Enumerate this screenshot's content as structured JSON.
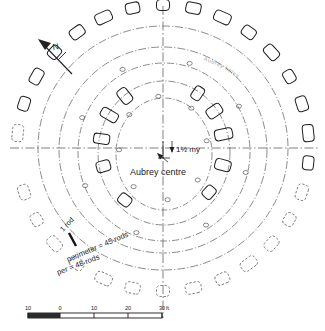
{
  "figure": {
    "kind": "archaeological-site-plan",
    "background_color": "#ffffff",
    "ink_color": "#222222",
    "faint_ink_color": "#9a9a9a"
  },
  "annotations": {
    "north_label": "N",
    "centre_offset_label": "1½ my",
    "centre_label": "Aubrey centre",
    "rod_label": "1 rod",
    "perimeter_outer_label": "perimeter = 45 rods",
    "perimeter_inner_label": "per = 48 rods",
    "arc_label_right": "Aubrey holes"
  },
  "scale_bar": {
    "unit_label": "ft",
    "ticks": [
      "10",
      "0",
      "10",
      "20",
      "30"
    ],
    "tick_positions_px": [
      10,
      42,
      76,
      110,
      144
    ],
    "hatched_from_px": 10,
    "hatched_to_px": 42,
    "bar_y_px": 313,
    "bar_height_px": 5
  },
  "chart_data": {
    "type": "scatter",
    "xlabel": "",
    "ylabel": "",
    "centre_px": [
      163,
      148
    ],
    "rings": [
      {
        "name": "sarsen-circle-outer-stones",
        "rx": 146,
        "ry": 143,
        "style": "solid",
        "stone_count": 30
      },
      {
        "name": "aubrey-dashed-ring",
        "rx": 120,
        "ry": 117,
        "style": "dashdot",
        "stone_count": 0
      },
      {
        "name": "bluestone-circle",
        "rx": 98,
        "ry": 96,
        "style": "dashdot",
        "stone_count": 0
      },
      {
        "name": "sarsen-trilithon-ring",
        "rx": 80,
        "ry": 84,
        "style": "dashdot",
        "stone_count": 0
      },
      {
        "name": "inner-bluestone-oval",
        "rx": 60,
        "ry": 66,
        "style": "dashdot",
        "stone_count": 0
      },
      {
        "name": "horseshoe-inner",
        "rx": 44,
        "ry": 52,
        "style": "dashdot",
        "stone_count": 0
      }
    ],
    "outer_stones_deg": [
      90,
      78,
      66,
      54,
      42,
      30,
      18,
      6,
      -6,
      -18,
      -30,
      -42,
      -54,
      -66,
      -78,
      -90,
      -102,
      -114,
      -126,
      -138,
      -150,
      -162,
      174,
      162,
      150,
      138,
      126,
      114,
      102
    ],
    "outer_stone_styles": [
      "solid",
      "solid",
      "solid",
      "solid",
      "solid",
      "solid",
      "solid",
      "solid",
      "solid",
      "dashed",
      "dashed",
      "dashed",
      "dashed",
      "dashed",
      "dashed",
      "dashed",
      "dashed",
      "dashed",
      "dashed",
      "dashed",
      "dashed",
      "dashed",
      "dashed",
      "solid",
      "solid",
      "solid",
      "solid",
      "solid",
      "solid"
    ],
    "inner_trilithon_stones": [
      {
        "deg": 128,
        "w": 11,
        "h": 16,
        "style": "solid"
      },
      {
        "deg": 150,
        "w": 10,
        "h": 18,
        "style": "solid"
      },
      {
        "deg": 172,
        "w": 10,
        "h": 16,
        "style": "solid"
      },
      {
        "deg": 196,
        "w": 11,
        "h": 14,
        "style": "solid"
      },
      {
        "deg": 232,
        "w": 13,
        "h": 11,
        "style": "solid"
      },
      {
        "deg": 318,
        "w": 13,
        "h": 11,
        "style": "solid"
      },
      {
        "deg": 345,
        "w": 11,
        "h": 16,
        "style": "solid"
      },
      {
        "deg": 12,
        "w": 11,
        "h": 18,
        "style": "solid"
      },
      {
        "deg": 34,
        "w": 11,
        "h": 16,
        "style": "solid"
      },
      {
        "deg": 56,
        "w": 10,
        "h": 14,
        "style": "solid"
      }
    ],
    "bluestone_markers_deg": [
      118,
      140,
      160,
      182,
      205,
      228,
      252,
      276,
      300,
      322,
      344,
      8,
      28,
      50,
      72,
      96
    ],
    "grid": false,
    "legend": "none"
  },
  "axes": {
    "vertical_axis": {
      "name": "north-south-centreline",
      "style": "dash-dot"
    },
    "horizontal_axis": {
      "name": "east-west-centreline",
      "style": "dash-dot"
    }
  }
}
